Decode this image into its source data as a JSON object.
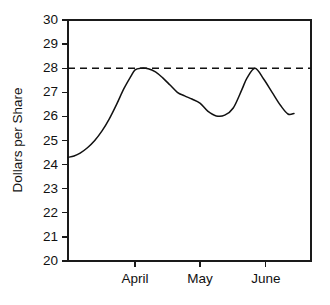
{
  "chart_data": {
    "type": "line",
    "title": "",
    "xlabel": "",
    "ylabel": "Dollars per Share",
    "ylim": [
      20,
      30
    ],
    "grid": false,
    "legend": null,
    "y_ticks": [
      30,
      29,
      28,
      27,
      26,
      25,
      24,
      23,
      22,
      21,
      20
    ],
    "y_tick_labels": [
      "30",
      "29",
      "28",
      "27",
      "26",
      "25",
      "24",
      "23",
      "22",
      "21",
      "20"
    ],
    "x_tick_labels": [
      "April",
      "May",
      "June"
    ],
    "x_tick_positions": [
      0.276,
      0.543,
      0.814
    ],
    "annotations": [
      {
        "name": "reference-line",
        "type": "horizontal-dashed-line",
        "value": 28,
        "style": "dashed",
        "color": "#111111"
      }
    ],
    "series": [
      {
        "name": "Dollars per Share",
        "color": "#111111",
        "x": [
          0.0,
          0.025,
          0.05,
          0.08,
          0.11,
          0.14,
          0.17,
          0.2,
          0.23,
          0.258,
          0.276,
          0.3,
          0.33,
          0.36,
          0.39,
          0.42,
          0.45,
          0.48,
          0.51,
          0.543,
          0.575,
          0.61,
          0.645,
          0.68,
          0.715,
          0.737,
          0.77,
          0.805,
          0.84,
          0.875,
          0.905,
          0.93
        ],
        "values": [
          24.3,
          24.36,
          24.48,
          24.7,
          25.0,
          25.4,
          25.9,
          26.5,
          27.15,
          27.65,
          27.93,
          28.0,
          27.98,
          27.85,
          27.6,
          27.3,
          27.0,
          26.85,
          26.72,
          26.55,
          26.22,
          26.02,
          26.05,
          26.35,
          27.1,
          27.6,
          28.0,
          27.55,
          27.0,
          26.45,
          26.1,
          26.12
        ]
      }
    ]
  },
  "colors": {
    "line": "#111111",
    "axis": "#1a1a1a",
    "background": "#ffffff"
  }
}
